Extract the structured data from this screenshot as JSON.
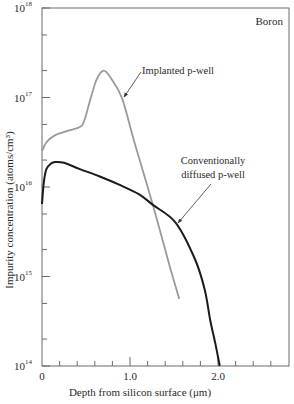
{
  "chart_data": {
    "type": "line",
    "title": "",
    "annotation_corner": "Boron",
    "xlabel": "Depth from silicon surface (μm)",
    "ylabel": "Impurity concentration (atoms/cm³)",
    "xlim": [
      0,
      2.8
    ],
    "ylim_log10": [
      14,
      18
    ],
    "yscale": "log",
    "x_ticks": [
      {
        "value": 0,
        "label": "0"
      },
      {
        "value": 1.0,
        "label": "1.0"
      },
      {
        "value": 2.0,
        "label": "2.0"
      }
    ],
    "y_ticks": [
      {
        "exp": 14,
        "label": "10",
        "sup": "14"
      },
      {
        "exp": 15,
        "label": "10",
        "sup": "15"
      },
      {
        "exp": 16,
        "label": "10",
        "sup": "16"
      },
      {
        "exp": 17,
        "label": "10",
        "sup": "17"
      },
      {
        "exp": 18,
        "label": "10",
        "sup": "18"
      }
    ],
    "grid": false,
    "series": [
      {
        "name": "Implanted p-well",
        "label_line1": "Implanted p-well",
        "color": "#9a9a9a",
        "x": [
          0,
          0.05,
          0.15,
          0.3,
          0.43,
          0.48,
          0.55,
          0.62,
          0.7,
          0.78,
          0.91,
          1.05,
          1.26,
          1.45,
          1.56
        ],
        "log10_y": [
          16.4,
          16.5,
          16.58,
          16.63,
          16.67,
          16.74,
          16.98,
          17.2,
          17.3,
          17.22,
          16.99,
          16.5,
          15.8,
          15.12,
          14.75
        ]
      },
      {
        "name": "Conventionally diffused p-well",
        "label_line1": "Conventionally",
        "label_line2": "diffused p-well",
        "color": "#1a1a1a",
        "x": [
          0,
          0.02,
          0.05,
          0.1,
          0.15,
          0.25,
          0.43,
          0.65,
          0.89,
          1.1,
          1.26,
          1.52,
          1.74,
          1.85,
          1.91,
          1.97,
          2.02
        ],
        "log10_y": [
          15.81,
          16.05,
          16.2,
          16.26,
          16.28,
          16.27,
          16.2,
          16.12,
          16.02,
          15.92,
          15.8,
          15.6,
          15.19,
          14.85,
          14.52,
          14.25,
          14.0
        ]
      }
    ]
  }
}
